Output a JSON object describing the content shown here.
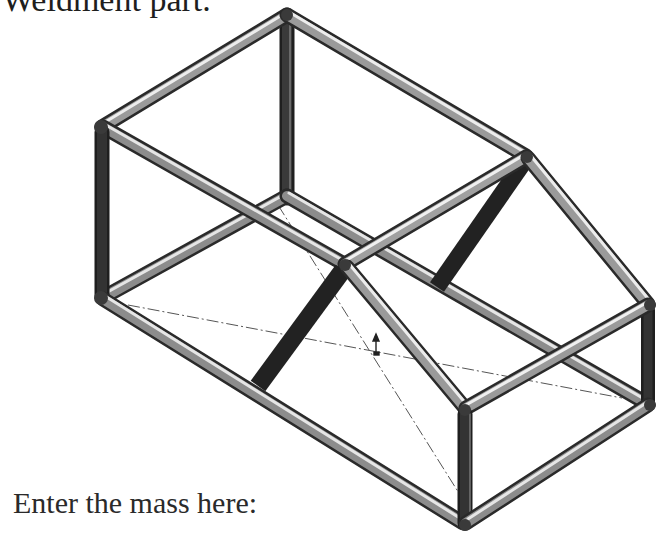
{
  "document": {
    "heading_partial": "Weldment part.",
    "prompt": "Enter the mass here:"
  },
  "figure": {
    "colors": {
      "tube_light": "#d9d9d9",
      "tube_mid": "#8a8a8a",
      "tube_dark": "#2e2e2e",
      "centerline": "#555555"
    }
  }
}
